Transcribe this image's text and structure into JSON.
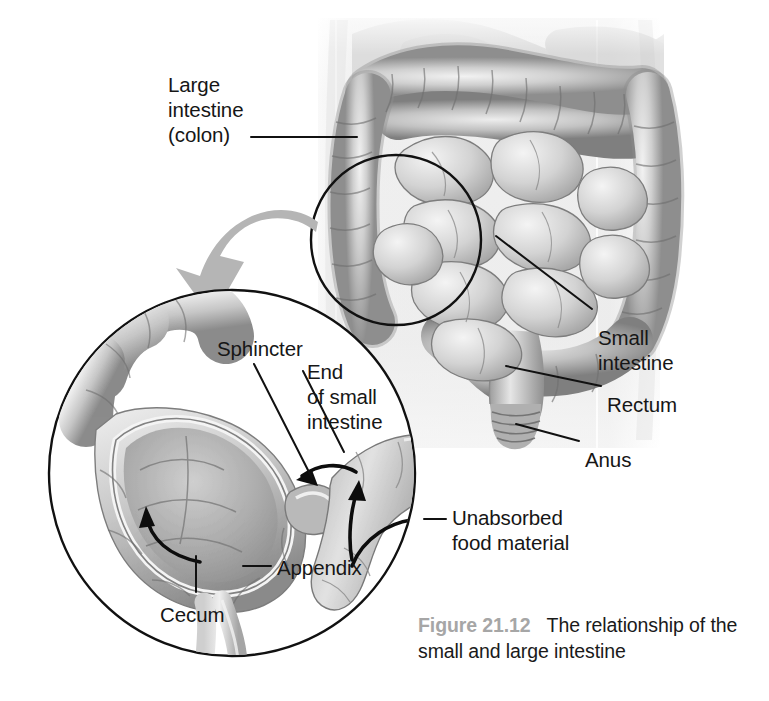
{
  "figure": {
    "number_label": "Figure 21.12",
    "caption_text": "The relationship of the small and large intestine",
    "number_color": "#a6a6a6",
    "caption_color": "#1a1a1a",
    "background_color": "#ffffff"
  },
  "main_diagram": {
    "labels": [
      {
        "id": "large-intestine",
        "lines": [
          "Large",
          "intestine",
          "(colon)"
        ],
        "x": 168,
        "y": 72
      },
      {
        "id": "small-intestine",
        "lines": [
          "Small",
          "intestine"
        ],
        "x": 598,
        "y": 325
      },
      {
        "id": "rectum",
        "lines": [
          "Rectum"
        ],
        "x": 607,
        "y": 392
      },
      {
        "id": "anus",
        "lines": [
          "Anus"
        ],
        "x": 585,
        "y": 447
      }
    ],
    "leader_line_color": "#111111",
    "illustration_style": "grayscale pencil rendering of abdominal viscera",
    "highlight_circle": {
      "cx": 396,
      "cy": 240,
      "r": 85,
      "stroke": "#111111"
    }
  },
  "inset": {
    "circle": {
      "cx": 232,
      "cy": 473,
      "r": 183,
      "stroke": "#111111"
    },
    "zoom_arrow_color": "#b5b5b5",
    "labels": [
      {
        "id": "sphincter",
        "lines": [
          "Sphincter"
        ],
        "x": 217,
        "y": 336
      },
      {
        "id": "end-of-small-intestine",
        "lines": [
          "End",
          "of small",
          "intestine"
        ],
        "x": 307,
        "y": 359
      },
      {
        "id": "unabsorbed-food-material",
        "lines": [
          "Unabsorbed",
          "food material"
        ],
        "x": 452,
        "y": 505
      },
      {
        "id": "appendix",
        "lines": [
          "Appendix"
        ],
        "x": 277,
        "y": 555
      },
      {
        "id": "cecum",
        "lines": [
          "Cecum"
        ],
        "x": 160,
        "y": 602
      }
    ],
    "flow_arrow_color": "#0d0d0d"
  },
  "colors": {
    "ink": "#111111",
    "tissue_light": "#dedede",
    "tissue_mid": "#b8b8b8",
    "tissue_dark": "#8c8c8c",
    "body_tint": "#ededed"
  }
}
